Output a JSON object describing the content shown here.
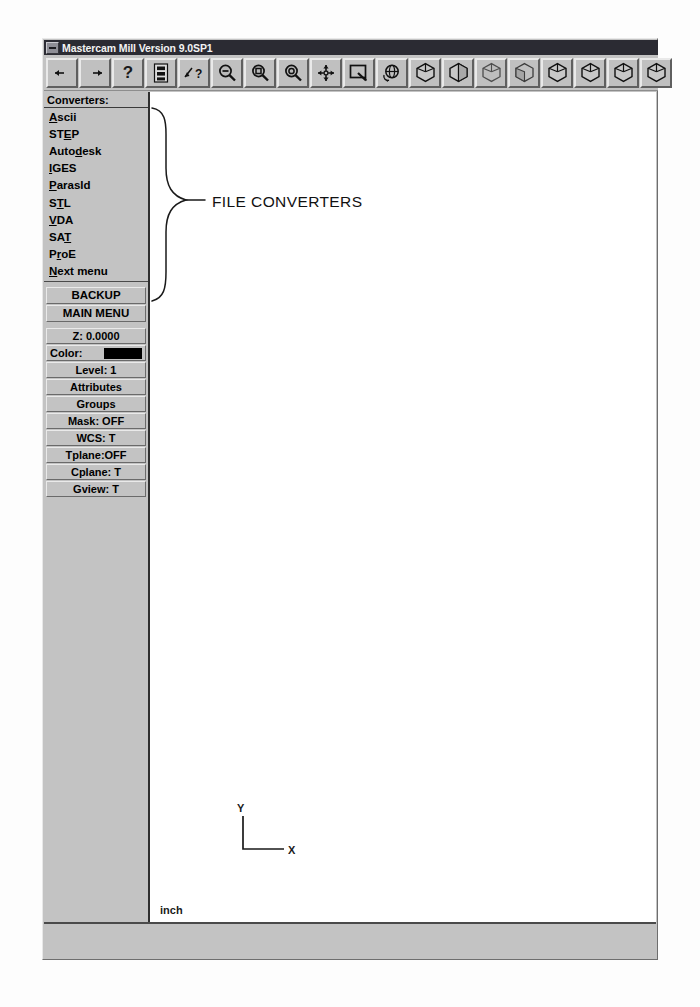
{
  "window": {
    "title": "Mastercam Mill Version 9.0SP1",
    "sysmenu_icon": "system-menu-icon"
  },
  "toolbar": {
    "buttons": [
      {
        "name": "back-arrow-button",
        "icon": "left-arrow-icon",
        "glyph": "←"
      },
      {
        "name": "forward-arrow-button",
        "icon": "right-arrow-icon",
        "glyph": "→"
      },
      {
        "name": "help-button",
        "icon": "question-mark-icon",
        "glyph": "?"
      },
      {
        "name": "file-list-button",
        "icon": "document-list-icon",
        "glyph": ""
      },
      {
        "name": "context-help-button",
        "icon": "help-pointer-icon",
        "glyph": ""
      },
      {
        "name": "zoom-out-button",
        "icon": "magnifier-minus-icon",
        "glyph": ""
      },
      {
        "name": "zoom-window-button",
        "icon": "magnifier-window-icon",
        "glyph": ""
      },
      {
        "name": "zoom-target-button",
        "icon": "magnifier-target-icon",
        "glyph": ""
      },
      {
        "name": "fit-screen-button",
        "icon": "four-way-arrow-icon",
        "glyph": ""
      },
      {
        "name": "repaint-button",
        "icon": "screen-repaint-icon",
        "glyph": ""
      },
      {
        "name": "dynamic-rotate-button",
        "icon": "rotate-sphere-icon",
        "glyph": ""
      },
      {
        "name": "view-isometric-button",
        "icon": "cube-isometric-icon",
        "glyph": ""
      },
      {
        "name": "view-front-button",
        "icon": "cube-front-icon",
        "glyph": ""
      },
      {
        "name": "view-back-button",
        "icon": "cube-back-icon",
        "glyph": ""
      },
      {
        "name": "view-bottom-button",
        "icon": "cube-bottom-icon",
        "glyph": ""
      },
      {
        "name": "view-top-button",
        "icon": "cube-top-icon",
        "glyph": ""
      },
      {
        "name": "view-right-button",
        "icon": "cube-right-icon",
        "glyph": ""
      },
      {
        "name": "view-left-button",
        "icon": "cube-left-icon",
        "glyph": ""
      },
      {
        "name": "view-axonometric-button",
        "icon": "cube-axonometric-icon",
        "glyph": ""
      }
    ]
  },
  "menu": {
    "header": "Converters:",
    "converters": [
      {
        "pre": "",
        "key": "A",
        "post": "scii"
      },
      {
        "pre": "ST",
        "key": "E",
        "post": "P"
      },
      {
        "pre": "Auto",
        "key": "d",
        "post": "esk"
      },
      {
        "pre": "",
        "key": "I",
        "post": "GES"
      },
      {
        "pre": "",
        "key": "P",
        "post": "arasld"
      },
      {
        "pre": "S",
        "key": "T",
        "post": "L"
      },
      {
        "pre": "",
        "key": "V",
        "post": "DA"
      },
      {
        "pre": "SA",
        "key": "T",
        "post": ""
      },
      {
        "pre": "P",
        "key": "r",
        "post": "oE"
      },
      {
        "pre": "",
        "key": "N",
        "post": "ext menu"
      }
    ],
    "commands": [
      {
        "label": "BACKUP"
      },
      {
        "label": "MAIN MENU"
      }
    ],
    "status": [
      {
        "label": "Z: 0.0000",
        "swatch": null,
        "align": "center"
      },
      {
        "label": "Color:",
        "swatch": "#000000",
        "align": "left"
      },
      {
        "label": "Level: 1",
        "swatch": null,
        "align": "center"
      },
      {
        "label": "Attributes",
        "swatch": null,
        "align": "center"
      },
      {
        "label": "Groups",
        "swatch": null,
        "align": "center"
      },
      {
        "label": "Mask: OFF",
        "swatch": null,
        "align": "center"
      },
      {
        "label": "WCS:  T",
        "swatch": null,
        "align": "center"
      },
      {
        "label": "Tplane:OFF",
        "swatch": null,
        "align": "center"
      },
      {
        "label": "Cplane:  T",
        "swatch": null,
        "align": "center"
      },
      {
        "label": "Gview:  T",
        "swatch": null,
        "align": "center"
      }
    ]
  },
  "graphics": {
    "axis_y_label": "Y",
    "axis_x_label": "X",
    "unit": "inch"
  },
  "annotation": {
    "callout_label": "FILE CONVERTERS",
    "brace_icon": "curly-brace-callout"
  }
}
